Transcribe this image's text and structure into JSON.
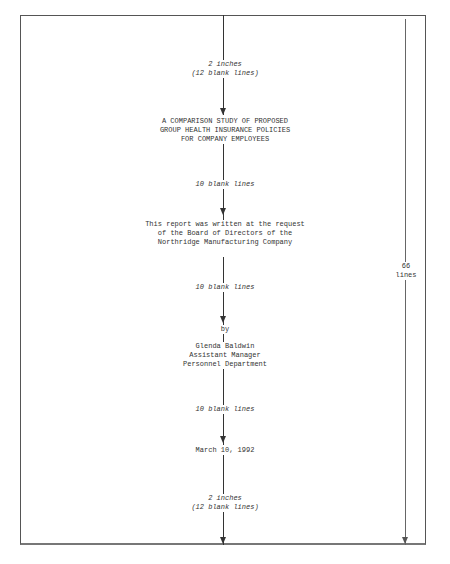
{
  "layout": {
    "total_lines_label": [
      "66",
      "lines"
    ]
  },
  "sections": {
    "top_margin": {
      "line1": "2 inches",
      "line2": "(12 blank lines)"
    },
    "title": {
      "lines": [
        "A COMPARISON STUDY OF PROPOSED",
        "GROUP HEALTH INSURANCE POLICIES",
        "FOR COMPANY EMPLOYEES"
      ]
    },
    "gap1": {
      "label": "10 blank lines"
    },
    "statement": {
      "lines": [
        "This report was written at the request",
        "of the Board of Directors of the",
        "Northridge Manufacturing Company"
      ]
    },
    "gap2": {
      "label": "10 blank lines"
    },
    "by": {
      "label": "by"
    },
    "author": {
      "lines": [
        "Glenda Baldwin",
        "Assistant Manager",
        "Personnel Department"
      ]
    },
    "gap3": {
      "label": "10 blank lines"
    },
    "date": {
      "label": "March 10, 1992"
    },
    "bottom_margin": {
      "line1": "2 inches",
      "line2": "(12 blank lines)"
    }
  }
}
